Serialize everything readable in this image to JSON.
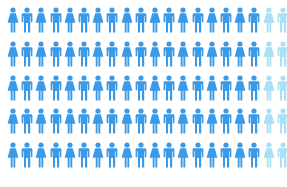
{
  "chart_data": {
    "type": "pictogram",
    "title": "",
    "rows": 5,
    "columns": 20,
    "total_icons": 100,
    "highlighted_icons": 90,
    "unhighlighted_icons": 10,
    "percent_highlighted": 90,
    "icon_pattern": [
      "female",
      "male"
    ],
    "colors": {
      "highlighted": "#3a9ae8",
      "unhighlighted": "#a8e0f5"
    },
    "caption": ""
  }
}
